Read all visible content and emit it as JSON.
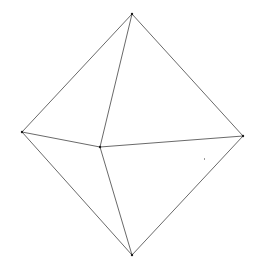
{
  "diagram": {
    "type": "wireframe-octahedron",
    "width": 256,
    "height": 270,
    "stroke_color": "#6a6a6a",
    "vertex_color": "#1a1a1a",
    "vertices": {
      "top": {
        "x": 132,
        "y": 14
      },
      "left": {
        "x": 22,
        "y": 132
      },
      "right": {
        "x": 243,
        "y": 136
      },
      "front": {
        "x": 100,
        "y": 147
      },
      "bottom": {
        "x": 132,
        "y": 255
      }
    },
    "edges": [
      [
        "top",
        "left"
      ],
      [
        "top",
        "right"
      ],
      [
        "top",
        "front"
      ],
      [
        "left",
        "front"
      ],
      [
        "front",
        "right"
      ],
      [
        "left",
        "bottom"
      ],
      [
        "right",
        "bottom"
      ],
      [
        "front",
        "bottom"
      ]
    ],
    "specks": [
      {
        "x": 204,
        "y": 158
      }
    ]
  }
}
